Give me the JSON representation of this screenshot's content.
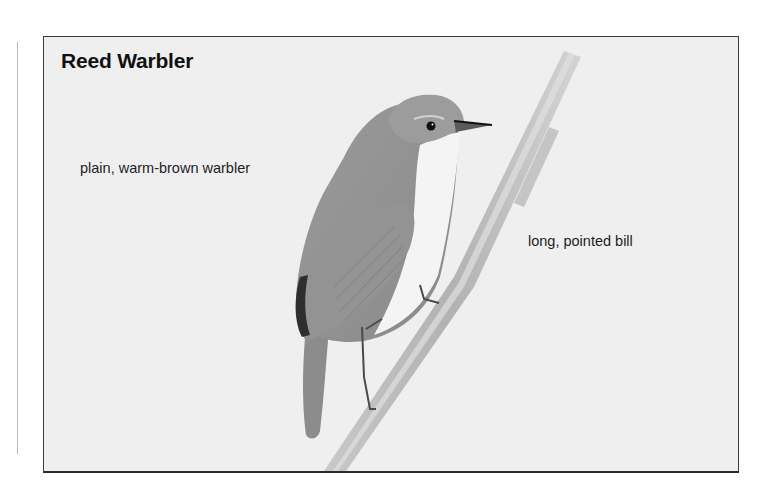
{
  "plate": {
    "title": "Reed Warbler",
    "annotations": [
      {
        "text": "plain, warm-brown warbler"
      },
      {
        "text": "long, pointed bill"
      }
    ],
    "illustration": "reed-warbler-perched-on-reed-stem"
  },
  "colors": {
    "background": "#efefef",
    "border": "#3a3a3a",
    "text": "#1e1e1e"
  }
}
